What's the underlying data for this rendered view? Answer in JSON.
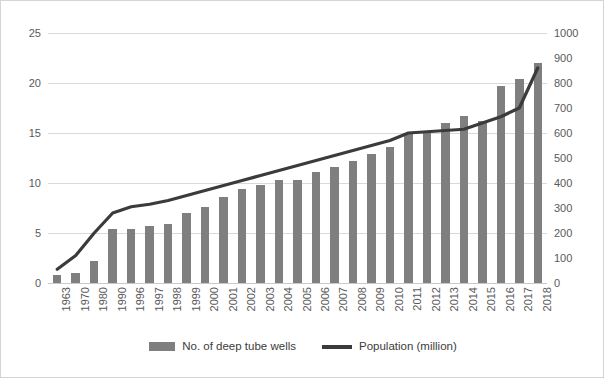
{
  "chart_data": {
    "type": "bar",
    "title": "",
    "xlabel": "",
    "ylabel": "",
    "grid": true,
    "legend_position": "bottom-center",
    "categories": [
      "1963",
      "1970",
      "1980",
      "1990",
      "1996",
      "1997",
      "1998",
      "1999",
      "2000",
      "2001",
      "2002",
      "2003",
      "2004",
      "2005",
      "2006",
      "2007",
      "2008",
      "2009",
      "2010",
      "2011",
      "2012",
      "2013",
      "2014",
      "2015",
      "2016",
      "2017",
      "2018"
    ],
    "axes": {
      "left": {
        "label": "",
        "ticks": [
          0,
          5,
          10,
          15,
          20,
          25
        ],
        "ylim": [
          0,
          25
        ],
        "series": "No. of deep tube wells"
      },
      "right": {
        "label": "",
        "ticks": [
          0,
          100,
          200,
          300,
          400,
          500,
          600,
          700,
          800,
          900,
          1000
        ],
        "ylim": [
          0,
          1000
        ],
        "series": "Population (million)"
      }
    },
    "series": [
      {
        "name": "No. of deep tube wells",
        "type": "bar",
        "axis": "left",
        "color": "#7f7f7f",
        "values": [
          0.8,
          1.0,
          2.2,
          5.4,
          5.4,
          5.7,
          5.9,
          7.0,
          7.6,
          8.6,
          9.4,
          9.8,
          10.3,
          10.3,
          11.1,
          11.6,
          12.2,
          12.9,
          13.6,
          15.0,
          15.1,
          16.0,
          16.7,
          16.2,
          19.7,
          20.4,
          22.0
        ]
      },
      {
        "name": "Population (million)",
        "type": "line",
        "axis": "right",
        "color": "#3b3b3b",
        "values": [
          55,
          110,
          200,
          280,
          305,
          315,
          330,
          350,
          370,
          390,
          410,
          430,
          450,
          470,
          490,
          510,
          530,
          550,
          570,
          600,
          605,
          610,
          615,
          640,
          665,
          700,
          860
        ]
      }
    ]
  },
  "legend": {
    "entries": [
      {
        "label": "No. of deep tube wells",
        "marker": "bar-swatch",
        "color": "#7f7f7f"
      },
      {
        "label": "Population (million)",
        "marker": "line-swatch",
        "color": "#3b3b3b"
      }
    ]
  },
  "colors": {
    "bar": "#7f7f7f",
    "line": "#3b3b3b",
    "gridline": "#d9d9d9",
    "border": "#d4d4d4",
    "text": "#59595b",
    "background": "#ffffff"
  }
}
